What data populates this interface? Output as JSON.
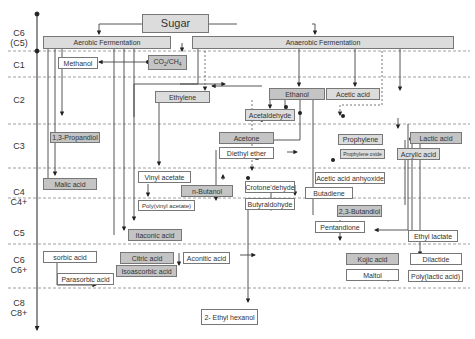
{
  "diagram": {
    "root": "Sugar",
    "processes": {
      "aerobic": "Aerobic Fermentation",
      "anaerobic": "Anaerobic Fermentation"
    },
    "carbon_levels": [
      {
        "id": "c6c5",
        "label": "C6\n(C5)"
      },
      {
        "id": "c1",
        "label": "C1"
      },
      {
        "id": "c2",
        "label": "C2"
      },
      {
        "id": "c3",
        "label": "C3"
      },
      {
        "id": "c4",
        "label": "C4\nC4+"
      },
      {
        "id": "c5",
        "label": "C5"
      },
      {
        "id": "c6",
        "label": "C6\nC6+"
      },
      {
        "id": "c8",
        "label": "C8\nC8+"
      }
    ],
    "nodes": {
      "co2ch4": "CO2/CH4",
      "methanol": "Methanol",
      "ethylene": "Ethylene",
      "ethanol": "Ethanol",
      "acetic_acid": "Acetic acid",
      "acetaldehyde": "Acetaldehyde",
      "propandiol": "1,3-Propandiol",
      "acetone": "Acetone",
      "diethyl_ether": "Diethyl ether",
      "prophylene": "Prophylene",
      "prophylene_oxide": "Prophylene oxide",
      "lactic_acid": "Lactic acid",
      "acrylic_acid": "Acrylic acid",
      "malic_acid": "Malic acid",
      "vinyl_acetate": "Vinyl acetate",
      "n_butanol": "n-Butanol",
      "poly_vinyl_acetate": "Poly(vinyl acetate)",
      "crotonaldehyde": "Crotone'dehyde",
      "acetic_anhydride": "Acetic acid anhyoxide",
      "butadiene": "Butadiene",
      "butyraldehyde": "Butyraldohyde",
      "butandiol": "2,3-Butandiol",
      "itaconic_acid": "Itaconic acid",
      "pentandione": "Pentandione",
      "ethyl_lactate": "Ethyl lactate",
      "sorbic_acid": "sorbic acid",
      "citric_acid": "Citric acid",
      "aconitic_acid": "Aconitic acid",
      "isoascorbic_acid": "Isoascorbic acid",
      "parasorbic_acid": "Parasorbic acid",
      "kojic_acid": "Kojic acid",
      "maltol": "Maltol",
      "dilactide": "Dilactide",
      "poly_lactic_acid": "Poly(lactic acid)",
      "ethyl_hexanol": "2- Ethyl hexanol"
    }
  }
}
